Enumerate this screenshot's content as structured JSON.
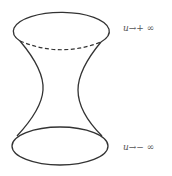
{
  "diagram": {
    "type": "hyperboloid-surface",
    "stroke_color": "#333333",
    "top_label": {
      "var": "u",
      "arrow": "→",
      "limit": "+ ∞"
    },
    "bottom_label": {
      "var": "u",
      "arrow": "→",
      "limit": "− ∞"
    }
  }
}
